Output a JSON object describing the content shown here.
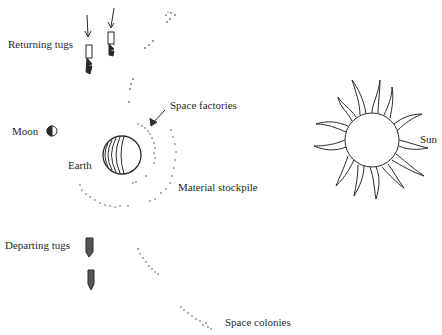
{
  "diagram": {
    "labels": {
      "returning_tugs": "Returning tugs",
      "space_factories": "Space factories",
      "moon": "Moon",
      "earth": "Earth",
      "material_stockpile": "Material stockpile",
      "departing_tugs": "Departing tugs",
      "space_colonies": "Space colonies",
      "sun": "Sun"
    },
    "icons": [
      "arrow-down-icon",
      "tug-icon",
      "moon-icon",
      "earth-icon",
      "sun-icon"
    ],
    "colors": {
      "ink": "#2a2a2a",
      "background": "#ffffff"
    }
  }
}
